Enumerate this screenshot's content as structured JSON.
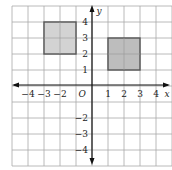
{
  "diagram": {
    "type": "coordinate-grid",
    "x_range": [
      -5,
      5
    ],
    "y_range": [
      -5,
      5
    ],
    "axis_labels": {
      "x": "x",
      "y": "y",
      "origin": "O"
    },
    "x_ticks": [
      "-4",
      "-3",
      "-2",
      "1",
      "2",
      "3",
      "4"
    ],
    "y_ticks": [
      "4",
      "3",
      "2",
      "1",
      "-2",
      "-3",
      "-4"
    ],
    "shapes": [
      {
        "name": "left-square",
        "x": [
          -3,
          -1
        ],
        "y": [
          2,
          4
        ],
        "fill": "#d3d3d3"
      },
      {
        "name": "right-square",
        "x": [
          1,
          3
        ],
        "y": [
          1,
          3
        ],
        "fill": "#bdbdbd"
      }
    ],
    "colors": {
      "grid": "#a8a8a8",
      "axis": "#111111",
      "shape_stroke": "#555555"
    }
  }
}
